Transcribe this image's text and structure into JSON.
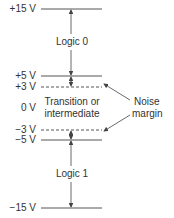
{
  "diagram": {
    "levels": [
      {
        "label": "+15 V",
        "y": 9,
        "style": "solid"
      },
      {
        "label": "+5 V",
        "y": 76,
        "style": "solid"
      },
      {
        "label": "+3 V",
        "y": 87,
        "style": "dashed"
      },
      {
        "label": "0 V",
        "y": 108,
        "style": "none"
      },
      {
        "label": "−3 V",
        "y": 130,
        "style": "dashed"
      },
      {
        "label": "−5 V",
        "y": 140,
        "style": "solid"
      },
      {
        "label": "−15 V",
        "y": 208,
        "style": "solid"
      }
    ],
    "regions": {
      "logic0": "Logic 0",
      "transition_line1": "Transition or",
      "transition_line2": "intermediate",
      "logic1": "Logic 1"
    },
    "annotation": {
      "line1": "Noise",
      "line2": "margin"
    },
    "colors": {
      "line": "#444444",
      "text": "#333333"
    }
  }
}
